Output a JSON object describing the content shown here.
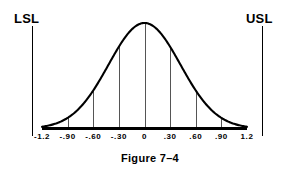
{
  "figure": {
    "caption": "Figure 7–4",
    "lsl_label": "LSL",
    "usl_label": "USL"
  },
  "chart_data": {
    "type": "line",
    "title": "Figure 7–4",
    "xlabel": "",
    "ylabel": "",
    "grid": true,
    "legend": false,
    "curve": "normal-distribution-bell-curve",
    "xlim": [
      -1.2,
      1.2
    ],
    "ylim": [
      0,
      1
    ],
    "tick_labels": [
      "-1.2",
      "-.90",
      "-.60",
      "-.30",
      "0",
      ".30",
      ".60",
      ".90",
      "1.2"
    ],
    "tick_values": [
      -1.2,
      -0.9,
      -0.6,
      -0.3,
      0,
      0.3,
      0.6,
      0.9,
      1.2
    ],
    "gridline_ticks": [
      -0.9,
      -0.6,
      -0.3,
      0,
      0.3,
      0.6,
      0.9
    ],
    "x": [
      -1.2,
      -1.05,
      -0.9,
      -0.75,
      -0.6,
      -0.45,
      -0.3,
      -0.15,
      0,
      0.15,
      0.3,
      0.45,
      0.6,
      0.75,
      0.9,
      1.05,
      1.2
    ],
    "y": [
      0.03,
      0.05,
      0.09,
      0.17,
      0.28,
      0.44,
      0.64,
      0.85,
      1.0,
      0.85,
      0.64,
      0.44,
      0.28,
      0.17,
      0.09,
      0.05,
      0.03
    ],
    "spec_limits": [
      {
        "name": "LSL",
        "label": "LSL",
        "value": -1.2
      },
      {
        "name": "USL",
        "label": "USL",
        "value": 1.2
      }
    ],
    "colors": {
      "curve": "#000000",
      "axis": "#000000",
      "grid": "#555555",
      "background": "#ffffff"
    }
  }
}
